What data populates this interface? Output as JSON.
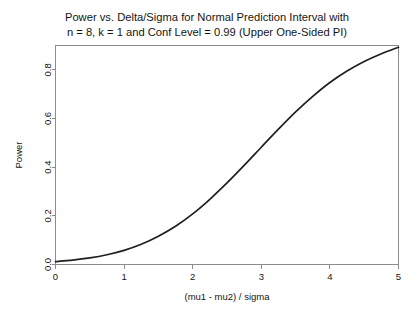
{
  "chart_data": {
    "type": "line",
    "title": "Power vs. Delta/Sigma for Normal Prediction Interval with",
    "subtitle": "n = 8, k = 1 and Conf Level = 0.99 (Upper One-Sided PI)",
    "xlabel": "(mu1 - mu2) / sigma",
    "ylabel": "Power",
    "xlim": [
      0,
      5
    ],
    "ylim": [
      0,
      0.9
    ],
    "grid": false,
    "legend": false,
    "xticks": [
      "0",
      "1",
      "2",
      "3",
      "4",
      "5"
    ],
    "xtick_values": [
      0,
      1,
      2,
      3,
      4,
      5
    ],
    "yticks": [
      "0.0",
      "0.2",
      "0.4",
      "0.6",
      "0.8"
    ],
    "ytick_values": [
      0.0,
      0.2,
      0.4,
      0.6,
      0.8
    ],
    "line_color": "#1f1f1f",
    "x": [
      0.0,
      0.25,
      0.5,
      0.75,
      1.0,
      1.25,
      1.5,
      1.75,
      2.0,
      2.25,
      2.5,
      2.75,
      3.0,
      3.25,
      3.5,
      3.75,
      4.0,
      4.25,
      4.5,
      4.75,
      5.0
    ],
    "values": [
      0.012,
      0.018,
      0.027,
      0.04,
      0.058,
      0.083,
      0.116,
      0.157,
      0.208,
      0.268,
      0.335,
      0.407,
      0.482,
      0.556,
      0.627,
      0.691,
      0.748,
      0.795,
      0.834,
      0.866,
      0.893
    ]
  },
  "axis": {
    "tick_length": 4
  }
}
